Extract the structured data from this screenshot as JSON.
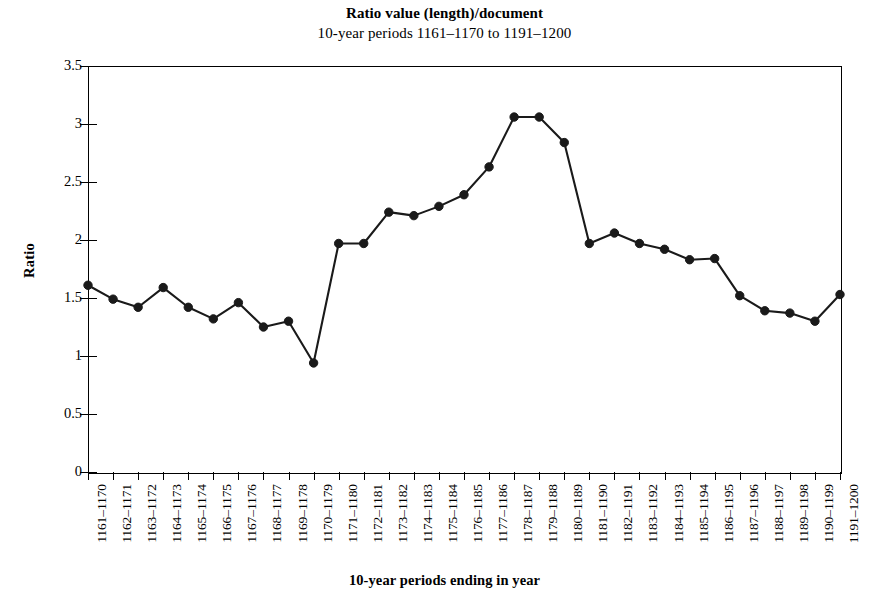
{
  "chart_data": {
    "type": "line",
    "title": "Ratio value (length)/document",
    "subtitle": "10-year periods 1161–1170 to 1191–1200",
    "xlabel": "10-year periods ending in year",
    "ylabel": "Ratio",
    "ylim": [
      0,
      3.5
    ],
    "ytick_labels": [
      "3.5",
      "3",
      "2.5",
      "2",
      "1.5",
      "1",
      "0.5",
      "0"
    ],
    "ytick_values": [
      3.5,
      3,
      2.5,
      2,
      1.5,
      1,
      0.5,
      0
    ],
    "grid": false,
    "legend": "none",
    "marker": "filled-circle",
    "line_color": "#1a1a1a",
    "marker_color": "#1a1a1a",
    "categories": [
      "1161–1170",
      "1162–1171",
      "1163–1172",
      "1164–1173",
      "1165–1174",
      "1166–1175",
      "1167–1176",
      "1168–1177",
      "1169–1178",
      "1170–1179",
      "1171–1180",
      "1172–1181",
      "1173–1182",
      "1174–1183",
      "1175–1184",
      "1176–1185",
      "1177–1186",
      "1178–1187",
      "1179–1188",
      "1180–1189",
      "1181–1190",
      "1182–1191",
      "1183–1192",
      "1184–1193",
      "1185–1194",
      "1186–1195",
      "1187–1196",
      "1188–1197",
      "1189–1198",
      "1190–1199",
      "1191–1200"
    ],
    "values": [
      1.61,
      1.49,
      1.42,
      1.59,
      1.42,
      1.32,
      1.46,
      1.25,
      1.3,
      0.94,
      1.97,
      1.97,
      2.24,
      2.21,
      2.29,
      2.39,
      2.63,
      3.06,
      3.06,
      2.84,
      1.97,
      2.06,
      1.97,
      1.92,
      1.83,
      1.84,
      1.52,
      1.39,
      1.37,
      1.3,
      1.53
    ]
  }
}
